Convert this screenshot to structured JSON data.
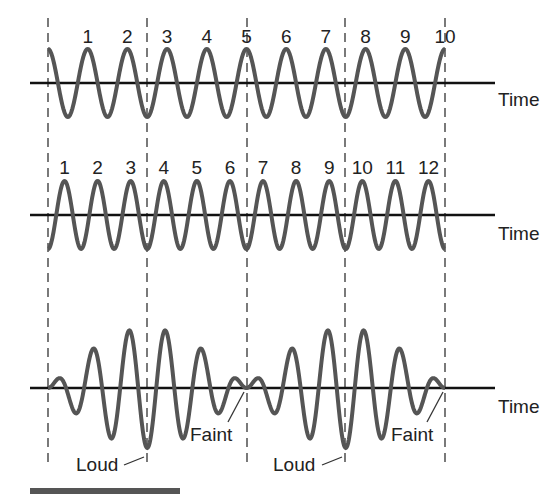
{
  "diagram": {
    "wave_colors": {
      "wave": "#555555",
      "axis": "#111111",
      "dash": "#333333"
    },
    "panels": [
      {
        "name": "wave-a",
        "cycle_labels": [
          "1",
          "2",
          "3",
          "4",
          "5",
          "6",
          "7",
          "8",
          "9",
          "10"
        ],
        "axis_label": "Time",
        "cycles": 10
      },
      {
        "name": "wave-b",
        "cycle_labels": [
          "1",
          "2",
          "3",
          "4",
          "5",
          "6",
          "7",
          "8",
          "9",
          "10",
          "11",
          "12"
        ],
        "axis_label": "Time",
        "cycles": 12
      },
      {
        "name": "beat",
        "axis_label": "Time",
        "annotations": {
          "loud_1": "Loud",
          "faint_1": "Faint",
          "loud_2": "Loud",
          "faint_2": "Faint"
        }
      }
    ]
  }
}
